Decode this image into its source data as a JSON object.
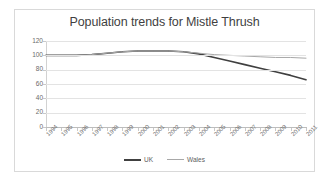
{
  "chart_data": {
    "type": "line",
    "title": "Population trends for Mistle Thrush",
    "xlabel": "",
    "ylabel": "",
    "ylim": [
      0,
      120
    ],
    "yticks": [
      0,
      20,
      40,
      60,
      80,
      100,
      120
    ],
    "grid": true,
    "legend_position": "bottom",
    "categories": [
      "1994",
      "1995",
      "1996",
      "1997",
      "1998",
      "1999",
      "2000",
      "2001",
      "2002",
      "2003",
      "2004",
      "2005",
      "2006",
      "2007",
      "2008",
      "2009",
      "2010",
      "2011"
    ],
    "series": [
      {
        "name": "UK",
        "color": "#404040",
        "values": [
          100,
          100,
          100,
          101,
          103,
          105,
          106,
          106,
          106,
          105,
          102,
          97,
          92,
          87,
          82,
          77,
          72,
          66
        ]
      },
      {
        "name": "Wales",
        "color": "#a8a8a8",
        "values": [
          100,
          100,
          100,
          101,
          103,
          105,
          106,
          106,
          106,
          105,
          103,
          101,
          100,
          99,
          98,
          97,
          97,
          96
        ]
      }
    ]
  },
  "legend": {
    "items": [
      {
        "label": "UK"
      },
      {
        "label": "Wales"
      }
    ]
  }
}
